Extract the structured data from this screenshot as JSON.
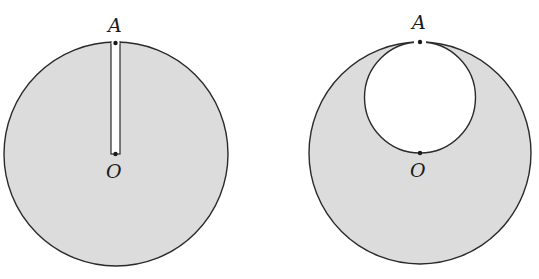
{
  "colors": {
    "fill": "#dcdcdc",
    "stroke": "#2a2a2a",
    "hole": "#ffffff",
    "background": "#ffffff"
  },
  "figures": [
    {
      "id": "left",
      "description": "Uniform disk with a thin radial slot cut from rim point A to center O",
      "labels": {
        "top": "A",
        "center": "O"
      }
    },
    {
      "id": "right",
      "description": "Uniform disk with a circular hole whose diameter spans from rim point A to center O",
      "labels": {
        "top": "A",
        "center": "O"
      }
    }
  ]
}
